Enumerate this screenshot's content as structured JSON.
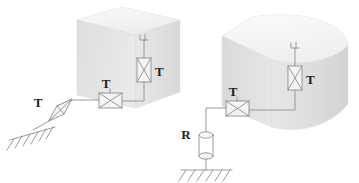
{
  "figure": {
    "background_color": "#ffffff",
    "line_color": "#8a8a8a",
    "label_color": "#1f1f1f",
    "block_face_colors": {
      "top": "#f2f2f2",
      "front": "#e2e2e2",
      "side": "#eaeaea"
    }
  },
  "assemblies": [
    {
      "id": "left-assembly",
      "name": "left-block-assembly",
      "block_shape": "rectangular-isometric-box",
      "components": [
        {
          "id": "l-valve-vertical",
          "symbol": "valve-x-box",
          "orientation": "vertical",
          "label": "T"
        },
        {
          "id": "l-valve-horizontal",
          "symbol": "valve-x-box",
          "orientation": "horizontal",
          "label": "T"
        },
        {
          "id": "l-valve-diagonal",
          "symbol": "valve-x-box",
          "orientation": "diagonal",
          "label": "T"
        },
        {
          "id": "l-ground",
          "symbol": "ground-hatch",
          "orientation": "horizontal",
          "label": ""
        },
        {
          "id": "l-antenna",
          "symbol": "port-antenna",
          "orientation": "vertical",
          "label": ""
        }
      ]
    },
    {
      "id": "right-assembly",
      "name": "right-block-assembly",
      "block_shape": "rounded-corner-isometric-box",
      "components": [
        {
          "id": "r-valve-vertical",
          "symbol": "valve-x-box",
          "orientation": "vertical",
          "label": "T"
        },
        {
          "id": "r-valve-horizontal",
          "symbol": "valve-x-box",
          "orientation": "horizontal",
          "label": "T"
        },
        {
          "id": "r-resistor",
          "symbol": "cylinder",
          "orientation": "vertical",
          "label": "R"
        },
        {
          "id": "r-ground",
          "symbol": "ground-hatch",
          "orientation": "horizontal",
          "label": ""
        },
        {
          "id": "r-antenna",
          "symbol": "port-antenna",
          "orientation": "vertical",
          "label": ""
        }
      ]
    }
  ],
  "labels": {
    "left_vertical_valve": "T",
    "left_horizontal_valve": "T",
    "left_diagonal_valve": "T",
    "right_vertical_valve": "T",
    "right_horizontal_valve": "T",
    "right_resistor": "R"
  }
}
